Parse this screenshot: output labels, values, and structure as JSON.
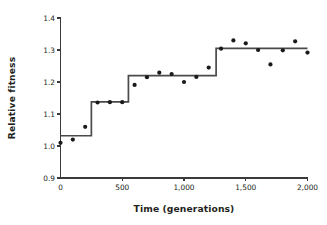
{
  "chart_data": {
    "type": "scatter",
    "title": "",
    "subtitle": "",
    "xlabel": "Time (generations)",
    "ylabel": "Relative fitness",
    "xlim": [
      0,
      2000
    ],
    "ylim": [
      0.9,
      1.4
    ],
    "grid": false,
    "legend": null,
    "legend_position": "none",
    "x_ticks": [
      0,
      500,
      1000,
      1500,
      2000
    ],
    "x_tick_labels": [
      "0",
      "500",
      "1,000",
      "1,500",
      "2,000"
    ],
    "y_ticks": [
      0.9,
      1.0,
      1.1,
      1.2,
      1.3,
      1.4
    ],
    "y_tick_labels": [
      "0.9",
      "1.0",
      "1.1",
      "1.2",
      "1.3",
      "1.4"
    ],
    "marker_color": "#1a1a1a",
    "line_color": "#4a4a4a",
    "axis_color": "#3a3a3a",
    "series": [
      {
        "name": "Observed relative fitness",
        "type": "scatter",
        "points": [
          {
            "x": 0,
            "y": 1.01
          },
          {
            "x": 100,
            "y": 1.02
          },
          {
            "x": 200,
            "y": 1.06
          },
          {
            "x": 300,
            "y": 1.136
          },
          {
            "x": 400,
            "y": 1.137
          },
          {
            "x": 500,
            "y": 1.137
          },
          {
            "x": 600,
            "y": 1.191
          },
          {
            "x": 700,
            "y": 1.215
          },
          {
            "x": 800,
            "y": 1.229
          },
          {
            "x": 900,
            "y": 1.225
          },
          {
            "x": 1000,
            "y": 1.2
          },
          {
            "x": 1100,
            "y": 1.216
          },
          {
            "x": 1200,
            "y": 1.245
          },
          {
            "x": 1300,
            "y": 1.304
          },
          {
            "x": 1400,
            "y": 1.33
          },
          {
            "x": 1500,
            "y": 1.321
          },
          {
            "x": 1600,
            "y": 1.3
          },
          {
            "x": 1700,
            "y": 1.255
          },
          {
            "x": 1800,
            "y": 1.299
          },
          {
            "x": 1900,
            "y": 1.327
          },
          {
            "x": 2000,
            "y": 1.292
          }
        ]
      },
      {
        "name": "Fitted step function",
        "type": "step",
        "steps": [
          {
            "x_start": 0,
            "x_end": 250,
            "y": 1.032
          },
          {
            "x_start": 250,
            "x_end": 550,
            "y": 1.138
          },
          {
            "x_start": 550,
            "x_end": 1260,
            "y": 1.22
          },
          {
            "x_start": 1260,
            "x_end": 2000,
            "y": 1.305
          }
        ]
      }
    ]
  }
}
